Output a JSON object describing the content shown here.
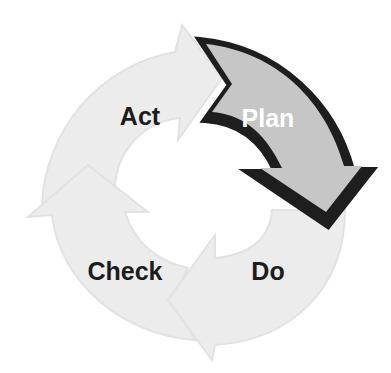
{
  "diagram": {
    "type": "cycle",
    "title": "",
    "colors": {
      "background": "#ffffff",
      "inactive_fill": "#ececec",
      "inactive_stroke": "#dedede",
      "active_fill": "#c6c6c6",
      "active_outline": "#1e1e1e",
      "label_dark": "#1c1c1c",
      "label_light": "#ffffff"
    },
    "steps": [
      {
        "id": "plan",
        "label": "Plan",
        "active": true
      },
      {
        "id": "do",
        "label": "Do",
        "active": false
      },
      {
        "id": "check",
        "label": "Check",
        "active": false
      },
      {
        "id": "act",
        "label": "Act",
        "active": false
      }
    ],
    "flow": [
      "Plan",
      "Do",
      "Check",
      "Act",
      "Plan"
    ]
  }
}
